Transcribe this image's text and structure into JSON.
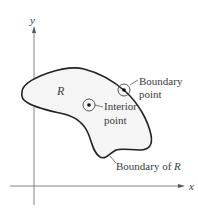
{
  "figure": {
    "axes": {
      "x_label": "x",
      "y_label": "y"
    },
    "region_label": "R",
    "boundary_point": {
      "line1": "Boundary",
      "line2": "point"
    },
    "interior_point": {
      "line1": "Interior",
      "line2": "point"
    },
    "boundary_caption": {
      "text": "Boundary of ",
      "var": "R"
    },
    "colors": {
      "region_fill": "#f5f5f5",
      "outline": "#222222",
      "axis": "#555555"
    }
  }
}
